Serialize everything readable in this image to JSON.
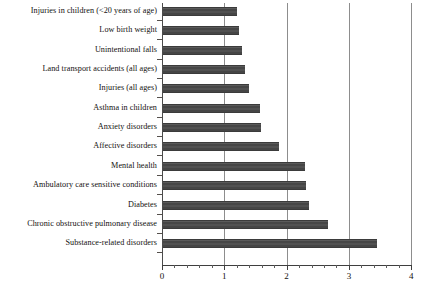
{
  "chart_data": {
    "type": "bar",
    "orientation": "horizontal",
    "title": "",
    "xlabel": "",
    "ylabel": "",
    "xlim": [
      0,
      4
    ],
    "grid": true,
    "legend": null,
    "xticks": [
      "0",
      "1",
      "2",
      "3",
      "4"
    ],
    "xtick_values": [
      0,
      1,
      2,
      3,
      4
    ],
    "minor_tick_step": 0.2,
    "bar_color": "#4e4e4e",
    "gridline_color": "#8d8d8d",
    "categories": [
      "Injuries in children (<20 years of age)",
      "Low birth weight",
      "Unintentional falls",
      "Land transport accidents (all ages)",
      "Injuries (all ages)",
      "Asthma in children",
      "Anxiety disorders",
      "Affective disorders",
      "Mental health",
      "Ambulatory care sensitive conditions",
      "Diabetes",
      "Chronic obstructive pulmonary disease",
      "Substance-related disorders"
    ],
    "values": [
      1.18,
      1.22,
      1.27,
      1.32,
      1.38,
      1.55,
      1.58,
      1.86,
      2.28,
      2.3,
      2.35,
      2.65,
      3.44
    ]
  }
}
